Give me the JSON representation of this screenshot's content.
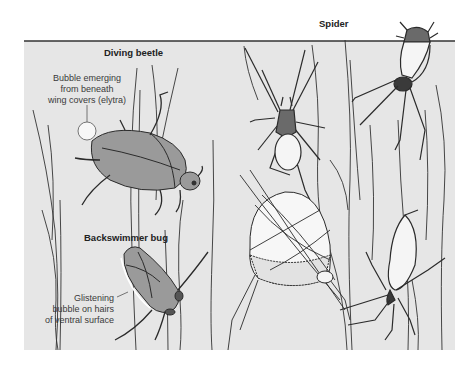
{
  "figure": {
    "colors": {
      "background": "#ffffff",
      "water": "#e6e6e6",
      "water_line": "#333333",
      "insect_fill": "#9a9a9a",
      "bubble_fill": "#f7f7f7",
      "outline": "#2b2b2b"
    },
    "labels": {
      "diving_beetle": "Diving beetle",
      "spider": "Spider",
      "backswimmer": "Backswimmer bug"
    },
    "annotations": {
      "beetle_bubble": [
        "Bubble emerging",
        "from beneath",
        "wing covers (elytra)"
      ],
      "backswimmer_bubble": [
        "Glistening",
        "bubble on hairs",
        "of ventral surface"
      ]
    }
  }
}
